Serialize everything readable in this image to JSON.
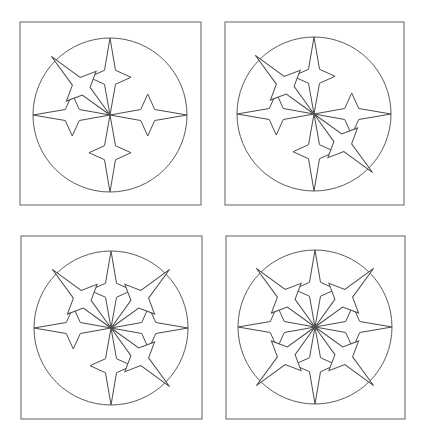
{
  "figure": {
    "colors": {
      "background": "#ffffff",
      "stroke": "#4a4a4a",
      "frame": "#6e6e6e"
    },
    "star_positions": {
      "up": 0,
      "upper_right": 45,
      "right": 90,
      "lower_right": 135,
      "down": 180,
      "lower_left": 225,
      "left": 270,
      "upper_left": 315
    },
    "panels": [
      {
        "id": 1,
        "frame": {
          "x": 20,
          "y": 22,
          "w": 181,
          "h": 183
        },
        "circle": {
          "cx": 110,
          "cy": 115,
          "r": 77
        },
        "stars": [
          "up",
          "right",
          "down",
          "left",
          "upper_left"
        ],
        "star_count": 5
      },
      {
        "id": 2,
        "frame": {
          "x": 225,
          "y": 22,
          "w": 179,
          "h": 183
        },
        "circle": {
          "cx": 314,
          "cy": 114,
          "r": 77
        },
        "stars": [
          "up",
          "right",
          "down",
          "left",
          "upper_left",
          "lower_right"
        ],
        "star_count": 6
      },
      {
        "id": 3,
        "frame": {
          "x": 21,
          "y": 236,
          "w": 181,
          "h": 183
        },
        "circle": {
          "cx": 111,
          "cy": 328,
          "r": 77
        },
        "stars": [
          "up",
          "right",
          "down",
          "left",
          "upper_left",
          "upper_right",
          "lower_right"
        ],
        "star_count": 7
      },
      {
        "id": 4,
        "frame": {
          "x": 226,
          "y": 236,
          "w": 179,
          "h": 183
        },
        "circle": {
          "cx": 315,
          "cy": 327,
          "r": 77
        },
        "stars": [
          "up",
          "right",
          "down",
          "left",
          "upper_left",
          "upper_right",
          "lower_right",
          "lower_left"
        ],
        "star_count": 8
      }
    ]
  }
}
